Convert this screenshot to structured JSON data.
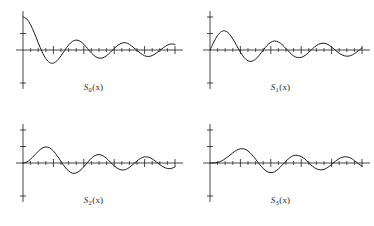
{
  "figure": {
    "background_color": "#ffffff",
    "stroke_color": "#1a1a1a",
    "layout": "2x2 grid of four decaying-oscillation function plots"
  },
  "panels": [
    {
      "id": "panel-0",
      "caption_base": "S",
      "caption_index": "0",
      "caption_arg": "(x)",
      "caption_text": "S0(x)"
    },
    {
      "id": "panel-1",
      "caption_base": "S",
      "caption_index": "1",
      "caption_arg": "(x)",
      "caption_text": "S1(x)"
    },
    {
      "id": "panel-2",
      "caption_base": "S",
      "caption_index": "2",
      "caption_arg": "(x)",
      "caption_text": "S2(x)"
    },
    {
      "id": "panel-3",
      "caption_base": "S",
      "caption_index": "3",
      "caption_arg": "(x)",
      "caption_text": "S3(x)"
    }
  ],
  "chart_data": [
    {
      "type": "line",
      "title": "S0(x)",
      "xlabel": "",
      "ylabel": "",
      "grid": false,
      "legend": null,
      "xlim": [
        0,
        20
      ],
      "ylim": [
        -1.1,
        1.1
      ],
      "x_major_ticks": [
        4,
        8,
        12,
        16,
        20
      ],
      "x_minor_ticks": [
        1,
        2,
        3,
        5,
        6,
        7,
        9,
        10,
        11,
        13,
        14,
        15,
        17,
        18,
        19
      ],
      "y_major_ticks": [
        -1,
        0.5
      ],
      "x": [
        0,
        0.5,
        1,
        1.5,
        2,
        2.5,
        3,
        3.5,
        4,
        4.5,
        5,
        5.5,
        6,
        6.5,
        7,
        7.5,
        8,
        8.5,
        9,
        9.5,
        10,
        10.5,
        11,
        11.5,
        12,
        12.5,
        13,
        13.5,
        14,
        14.5,
        15,
        15.5,
        16,
        16.5,
        17,
        17.5,
        18,
        18.5,
        19,
        19.5,
        20
      ],
      "values": [
        1.0,
        0.938,
        0.765,
        0.512,
        0.224,
        -0.048,
        -0.26,
        -0.38,
        -0.397,
        -0.321,
        -0.178,
        -0.007,
        0.151,
        0.26,
        0.3,
        0.266,
        0.172,
        0.042,
        -0.09,
        -0.194,
        -0.246,
        -0.237,
        -0.171,
        -0.068,
        0.047,
        0.146,
        0.207,
        0.22,
        0.171,
        0.083,
        -0.014,
        -0.104,
        -0.175,
        -0.196,
        -0.169,
        -0.101,
        -0.013,
        0.074,
        0.146,
        0.184,
        0.167
      ]
    },
    {
      "type": "line",
      "title": "S1(x)",
      "xlabel": "",
      "ylabel": "",
      "grid": false,
      "legend": null,
      "xlim": [
        0,
        20
      ],
      "ylim": [
        -1.1,
        1.1
      ],
      "x_major_ticks": [
        4,
        8,
        12,
        16,
        20
      ],
      "x_minor_ticks": [
        1,
        2,
        3,
        5,
        6,
        7,
        9,
        10,
        11,
        13,
        14,
        15,
        17,
        18,
        19
      ],
      "y_major_ticks": [
        -1,
        0.5,
        1
      ],
      "x": [
        0,
        0.5,
        1,
        1.5,
        2,
        2.5,
        3,
        3.5,
        4,
        4.5,
        5,
        5.5,
        6,
        6.5,
        7,
        7.5,
        8,
        8.5,
        9,
        9.5,
        10,
        10.5,
        11,
        11.5,
        12,
        12.5,
        13,
        13.5,
        14,
        14.5,
        15,
        15.5,
        16,
        16.5,
        17,
        17.5,
        18,
        18.5,
        19,
        19.5,
        20
      ],
      "values": [
        0.0,
        0.242,
        0.44,
        0.558,
        0.577,
        0.497,
        0.339,
        0.137,
        -0.066,
        -0.231,
        -0.328,
        -0.341,
        -0.277,
        -0.154,
        -0.005,
        0.135,
        0.235,
        0.273,
        0.245,
        0.161,
        0.043,
        -0.079,
        -0.177,
        -0.229,
        -0.223,
        -0.166,
        -0.07,
        0.042,
        0.133,
        0.193,
        0.205,
        0.17,
        0.09,
        -0.01,
        -0.098,
        -0.16,
        -0.188,
        -0.17,
        -0.111,
        -0.03,
        0.067
      ]
    },
    {
      "type": "line",
      "title": "S2(x)",
      "xlabel": "",
      "ylabel": "",
      "grid": false,
      "legend": null,
      "xlim": [
        0,
        20
      ],
      "ylim": [
        -1.1,
        1.1
      ],
      "x_major_ticks": [
        4,
        8,
        12,
        16,
        20
      ],
      "x_minor_ticks": [
        1,
        2,
        3,
        5,
        6,
        7,
        9,
        10,
        11,
        13,
        14,
        15,
        17,
        18,
        19
      ],
      "y_major_ticks": [
        -1,
        0.5,
        1
      ],
      "x": [
        0,
        0.5,
        1,
        1.5,
        2,
        2.5,
        3,
        3.5,
        4,
        4.5,
        5,
        5.5,
        6,
        6.5,
        7,
        7.5,
        8,
        8.5,
        9,
        9.5,
        10,
        10.5,
        11,
        11.5,
        12,
        12.5,
        13,
        13.5,
        14,
        14.5,
        15,
        15.5,
        16,
        16.5,
        17,
        17.5,
        18,
        18.5,
        19,
        19.5,
        20
      ],
      "values": [
        0.0,
        0.031,
        0.115,
        0.232,
        0.353,
        0.446,
        0.486,
        0.459,
        0.364,
        0.217,
        0.046,
        -0.117,
        -0.243,
        -0.307,
        -0.301,
        -0.23,
        -0.113,
        0.022,
        0.145,
        0.228,
        0.255,
        0.222,
        0.139,
        0.027,
        -0.085,
        -0.171,
        -0.212,
        -0.198,
        -0.134,
        -0.038,
        0.064,
        0.146,
        0.186,
        0.177,
        0.123,
        0.041,
        -0.048,
        -0.123,
        -0.166,
        -0.166,
        -0.116
      ]
    },
    {
      "type": "line",
      "title": "S3(x)",
      "xlabel": "",
      "ylabel": "",
      "grid": false,
      "legend": null,
      "xlim": [
        0,
        20
      ],
      "ylim": [
        -1.1,
        1.1
      ],
      "x_major_ticks": [
        4,
        8,
        12,
        16,
        20
      ],
      "x_minor_ticks": [
        1,
        2,
        3,
        5,
        6,
        7,
        9,
        10,
        11,
        13,
        14,
        15,
        17,
        18,
        19
      ],
      "y_major_ticks": [
        -1,
        0.5,
        1
      ],
      "x": [
        0,
        0.5,
        1,
        1.5,
        2,
        2.5,
        3,
        3.5,
        4,
        4.5,
        5,
        5.5,
        6,
        6.5,
        7,
        7.5,
        8,
        8.5,
        9,
        9.5,
        10,
        10.5,
        11,
        11.5,
        12,
        12.5,
        13,
        13.5,
        14,
        14.5,
        15,
        15.5,
        16,
        16.5,
        17,
        17.5,
        18,
        18.5,
        19,
        19.5,
        20
      ],
      "values": [
        0.0,
        0.0026,
        0.0196,
        0.061,
        0.129,
        0.217,
        0.309,
        0.387,
        0.43,
        0.424,
        0.365,
        0.256,
        0.115,
        -0.035,
        -0.167,
        -0.258,
        -0.291,
        -0.265,
        -0.181,
        -0.065,
        0.058,
        0.16,
        0.227,
        0.228,
        0.195,
        0.116,
        0.003,
        -0.103,
        -0.176,
        -0.207,
        -0.194,
        -0.132,
        -0.043,
        0.053,
        0.134,
        0.18,
        0.186,
        0.15,
        0.072,
        -0.019,
        -0.098
      ]
    }
  ]
}
